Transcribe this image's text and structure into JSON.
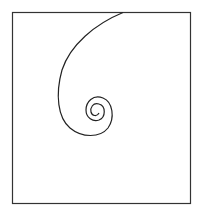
{
  "diagram": {
    "frame": {
      "x": 12,
      "y": 12,
      "width": 178,
      "height": 192,
      "stroke": "#333333"
    },
    "spiral": {
      "stroke": "#222222",
      "center": [
        95,
        110
      ]
    }
  }
}
